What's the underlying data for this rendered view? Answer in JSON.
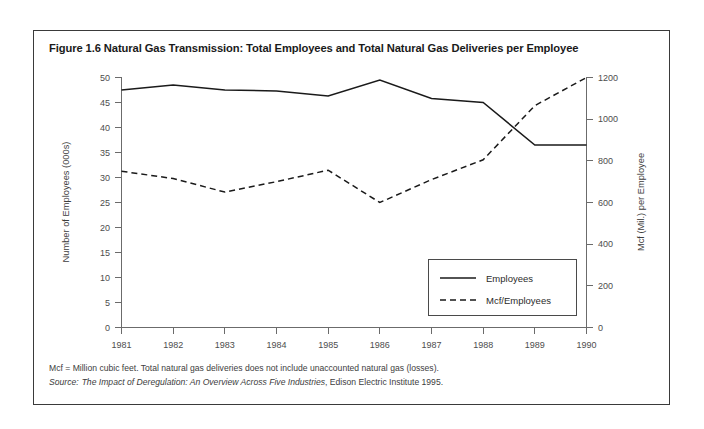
{
  "figure": {
    "title": "Figure 1.6 Natural Gas Transmission: Total Employees and Total Natural Gas Deliveries per Employee",
    "footnote": "Mcf = Million cubic feet. Total natural gas deliveries does not include unaccounted natural gas (losses).",
    "source_prefix": "Source:",
    "source_title": "The Impact of Deregulation: An Overview Across Five Industries",
    "source_suffix": ", Edison Electric Institute 1995."
  },
  "chart_data": {
    "type": "line",
    "title": "Figure 1.6 Natural Gas Transmission: Total Employees and Total Natural Gas Deliveries per Employee",
    "xlabel": "Year",
    "ylabel": "Number of Employees (000s)",
    "y2label": "Mcf (Mil.) per Employee",
    "x": [
      1981,
      1982,
      1983,
      1984,
      1985,
      1986,
      1987,
      1988,
      1989,
      1990
    ],
    "xtick_labels": [
      "1981",
      "1982",
      "1983",
      "1984",
      "1985",
      "1986",
      "1987",
      "1988",
      "1989",
      "1990"
    ],
    "ylim": [
      0,
      50
    ],
    "yticks": [
      0,
      5,
      10,
      15,
      20,
      25,
      30,
      35,
      40,
      45,
      50
    ],
    "ytick_labels": [
      "0",
      "5",
      "10",
      "15",
      "20",
      "25",
      "30",
      "35",
      "40",
      "45",
      "50"
    ],
    "y2lim": [
      0,
      1200
    ],
    "y2ticks": [
      0,
      200,
      400,
      600,
      800,
      1000,
      1200
    ],
    "y2tick_labels": [
      "0",
      "200",
      "400",
      "600",
      "800",
      "1000",
      "1200"
    ],
    "grid": false,
    "legend_position": "center-right-inside",
    "series": [
      {
        "name": "Employees",
        "axis": "left",
        "style": "solid",
        "units": "thousands of employees",
        "values": [
          47.5,
          48.5,
          47.5,
          47.3,
          46.3,
          49.5,
          45.8,
          45.0,
          36.5,
          36.5
        ]
      },
      {
        "name": "Mcf/Employees",
        "axis": "right",
        "style": "dashed",
        "units": "Mcf (Mil.) per employee",
        "values": [
          750,
          715,
          650,
          700,
          755,
          600,
          710,
          805,
          1065,
          1200
        ]
      }
    ]
  }
}
